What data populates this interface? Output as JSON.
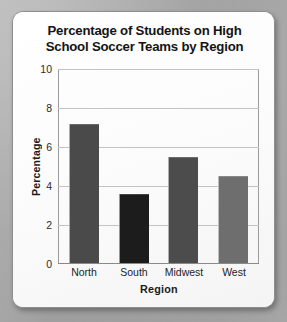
{
  "chart_data": {
    "type": "bar",
    "title": "Percentage of Students on High School Soccer Teams by Region",
    "title_line1": "Percentage of Students on High",
    "title_line2": "School Soccer Teams by Region",
    "categories": [
      "North",
      "South",
      "Midwest",
      "West"
    ],
    "values": [
      7.1,
      3.5,
      5.4,
      4.45
    ],
    "bar_colors": [
      "#4a4a4a",
      "#1c1c1c",
      "#4c4c4c",
      "#6e6e6e"
    ],
    "xlabel": "Region",
    "ylabel": "Percentage",
    "ylim": [
      0,
      10
    ],
    "yticks": [
      0,
      2,
      4,
      6,
      8,
      10
    ],
    "ytick_labels": [
      "0",
      "2",
      "4",
      "6",
      "8",
      "10"
    ],
    "grid": true,
    "grid_axis": "y",
    "legend": false,
    "legend_position": "none"
  },
  "card": {
    "background_color": "#fdfdfd",
    "border_color": "#8e8e8e"
  },
  "page": {
    "background_color": "#a9a9a9"
  }
}
